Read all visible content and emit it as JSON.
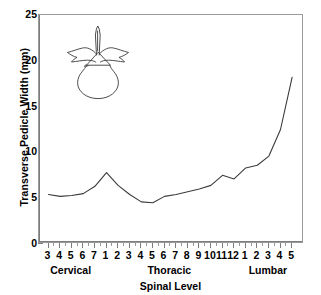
{
  "chart_data": {
    "type": "line",
    "title": "",
    "xlabel": "Spinal Level",
    "ylabel": "Transverse Pedicle Width (mm)",
    "ylim": [
      0,
      25
    ],
    "yticks": [
      0,
      5,
      10,
      15,
      20,
      25
    ],
    "ytick_labels": [
      "0",
      "5",
      "10",
      "15",
      "20",
      "25"
    ],
    "grid": false,
    "legend": "none",
    "categories": [
      "3",
      "4",
      "5",
      "6",
      "7",
      "1",
      "2",
      "3",
      "4",
      "5",
      "6",
      "7",
      "8",
      "9",
      "10",
      "11",
      "12",
      "1",
      "2",
      "3",
      "4",
      "5"
    ],
    "levels": [
      "C3",
      "C4",
      "C5",
      "C6",
      "C7",
      "T1",
      "T2",
      "T3",
      "T4",
      "T5",
      "T6",
      "T7",
      "T8",
      "T9",
      "T10",
      "T11",
      "T12",
      "L1",
      "L2",
      "L3",
      "L4",
      "L5"
    ],
    "values": [
      5.4,
      5.2,
      5.3,
      5.5,
      6.3,
      7.8,
      6.4,
      5.4,
      4.6,
      4.5,
      5.2,
      5.4,
      5.7,
      6.0,
      6.4,
      7.5,
      7.1,
      8.3,
      8.6,
      9.6,
      12.5,
      18.2
    ],
    "regions": [
      {
        "label": "Cervical",
        "start_index": 0,
        "end_index": 4
      },
      {
        "label": "Thoracic",
        "start_index": 5,
        "end_index": 16
      },
      {
        "label": "Lumbar",
        "start_index": 17,
        "end_index": 21
      }
    ],
    "line_color": "#3b3b3b",
    "annotations": [
      {
        "name": "vertebra-illustration",
        "description": "Outline drawing of a cervical vertebra (superior view)"
      }
    ]
  }
}
